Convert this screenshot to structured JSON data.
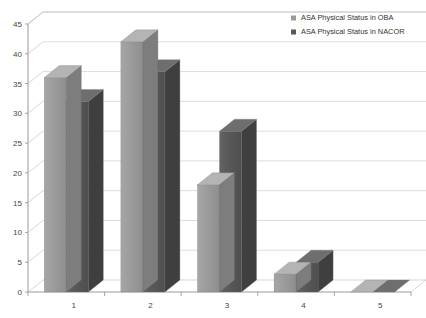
{
  "chart_data": {
    "type": "bar",
    "title": "",
    "subtitle": "",
    "xlabel": "",
    "ylabel": "",
    "categories": [
      "1",
      "2",
      "3",
      "4",
      "5"
    ],
    "series": [
      {
        "name": "ASA Physical Status in OBA",
        "color": "#9a9a9a",
        "values": [
          36,
          42,
          18,
          3,
          0
        ]
      },
      {
        "name": "ASA Physical Status in NACOR",
        "color": "#585858",
        "values": [
          32,
          37,
          27,
          5,
          0
        ]
      }
    ],
    "ylim": [
      0,
      45
    ],
    "yticks": [
      "0",
      "5",
      "10",
      "15",
      "20",
      "25",
      "30",
      "35",
      "40",
      "45"
    ],
    "ytick_values": [
      0,
      5,
      10,
      15,
      20,
      25,
      30,
      35,
      40,
      45
    ],
    "xticks": [
      "1",
      "2",
      "3",
      "4",
      "5"
    ],
    "grid": true,
    "grid_axis": "y",
    "legend_position": "top-right",
    "style": "3d-column",
    "background": "#ffffff",
    "gridline_color": "#cfcfcf",
    "axis_color": "#8f8f8f",
    "tick_label_color": "#444444"
  },
  "legend": {
    "items": [
      {
        "label": "ASA Physical Status in OBA",
        "color": "#9a9a9a"
      },
      {
        "label": "ASA Physical Status in NACOR",
        "color": "#585858"
      }
    ]
  }
}
